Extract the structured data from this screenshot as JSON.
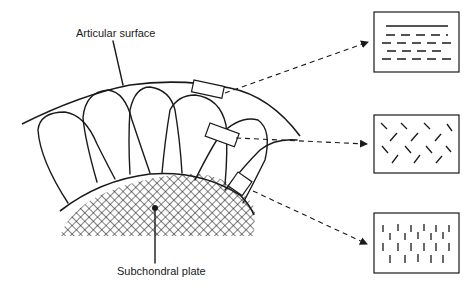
{
  "figure": {
    "labels": {
      "articular_surface": "Articular surface",
      "subchondral_plate": "Subchondral plate"
    },
    "colors": {
      "ink": "#1a1a1a",
      "background": "#ffffff"
    },
    "zones": [
      {
        "name": "superficial-zone",
        "orientation": "horizontal (parallel to surface)"
      },
      {
        "name": "middle-zone",
        "orientation": "oblique / random"
      },
      {
        "name": "deep-zone",
        "orientation": "vertical (perpendicular to surface)"
      }
    ]
  }
}
